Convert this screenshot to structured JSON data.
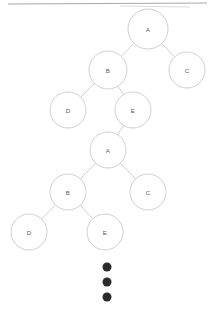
{
  "diagram": {
    "type": "tree-diagram",
    "background_color": "#ffffff",
    "node_fill": "#ffffff",
    "node_stroke": "#c9c9c9",
    "edge_stroke": "#c9c9c9",
    "label_color": "#5a5a5a",
    "dot_color": "#2b2b2b",
    "rule_color": "#a8a8a8",
    "canvas": {
      "width": 215,
      "height": 312
    },
    "top_rule": {
      "x1": 8,
      "y1": 4,
      "x2": 207,
      "y2": 3
    },
    "top_rule_faint": {
      "x1": 120,
      "y1": 6,
      "x2": 190,
      "y2": 7
    },
    "nodes": [
      {
        "id": "t1-a",
        "label": "A",
        "cx": 148,
        "cy": 29,
        "r": 20
      },
      {
        "id": "t1-b",
        "label": "B",
        "cx": 108,
        "cy": 70,
        "r": 19
      },
      {
        "id": "t1-c",
        "label": "C",
        "cx": 187,
        "cy": 70,
        "r": 18
      },
      {
        "id": "t1-d",
        "label": "D",
        "cx": 68,
        "cy": 110,
        "r": 18
      },
      {
        "id": "t1-e",
        "label": "E",
        "cx": 133,
        "cy": 110,
        "r": 18
      },
      {
        "id": "t2-a",
        "label": "A",
        "cx": 108,
        "cy": 150,
        "r": 18
      },
      {
        "id": "t2-b",
        "label": "B",
        "cx": 68,
        "cy": 192,
        "r": 18
      },
      {
        "id": "t2-c",
        "label": "C",
        "cx": 148,
        "cy": 192,
        "r": 18
      },
      {
        "id": "t2-d",
        "label": "D",
        "cx": 29,
        "cy": 232,
        "r": 18
      },
      {
        "id": "t2-e",
        "label": "E",
        "cx": 105,
        "cy": 232,
        "r": 18
      }
    ],
    "edges": [
      {
        "from": "t1-a",
        "to": "t1-b"
      },
      {
        "from": "t1-a",
        "to": "t1-c"
      },
      {
        "from": "t1-b",
        "to": "t1-d"
      },
      {
        "from": "t1-b",
        "to": "t1-e"
      },
      {
        "from": "t1-e",
        "to": "t2-a"
      },
      {
        "from": "t2-a",
        "to": "t2-b"
      },
      {
        "from": "t2-a",
        "to": "t2-c"
      },
      {
        "from": "t2-b",
        "to": "t2-d"
      },
      {
        "from": "t2-b",
        "to": "t2-e"
      }
    ],
    "ellipsis": {
      "label": "vertical-ellipsis",
      "cx": 107,
      "r": 4.5,
      "cys": [
        267,
        282,
        297
      ]
    }
  }
}
